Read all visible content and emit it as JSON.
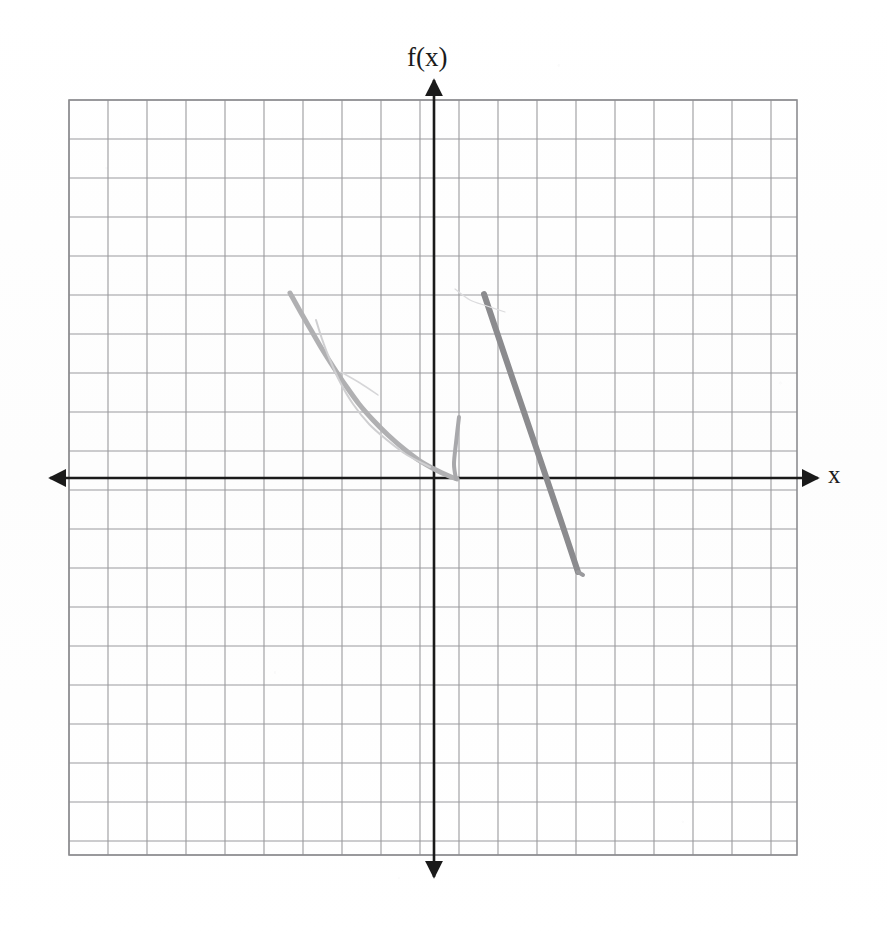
{
  "figure": {
    "kind": "hand-drawn-graph-worksheet",
    "background_color": "#fefefe",
    "grid": {
      "line_color": "#9a9a9d",
      "border_color": "#8d8d90",
      "cell_size_px": 39,
      "left_px": 69,
      "top_px": 100,
      "right_px": 797,
      "bottom_px": 855,
      "columns": 19,
      "rows": 19
    },
    "axes": {
      "color": "#1a1a1a",
      "x_axis_y_px": 478,
      "y_axis_x_px": 434,
      "x_axis_start_px": 50,
      "x_axis_end_px": 818,
      "y_axis_start_px": 80,
      "y_axis_end_px": 877,
      "arrowheads": [
        "left",
        "right",
        "up",
        "down"
      ]
    },
    "labels": {
      "y_axis": "f(x)",
      "x_axis": "x"
    }
  },
  "chart_data": {
    "type": "line",
    "title": "",
    "xlabel": "x",
    "ylabel": "f(x)",
    "grid": true,
    "legend": null,
    "axis_origin_px": {
      "x": 434,
      "y": 478
    },
    "unit_px": 39,
    "xlim": [
      -9.36,
      9.31
    ],
    "ylim": [
      -9.67,
      9.69
    ],
    "series": [
      {
        "name": "left-decreasing-curve",
        "stroke_color": "#b0b0b2",
        "stroke_width": 5,
        "description": "hand-drawn convex decreasing curve from upper-left down to the x-axis just right of the y-axis",
        "points_px": [
          [
            290,
            293
          ],
          [
            300,
            311
          ],
          [
            311,
            330
          ],
          [
            322,
            349
          ],
          [
            334,
            368
          ],
          [
            346,
            386
          ],
          [
            359,
            404
          ],
          [
            373,
            420
          ],
          [
            388,
            435
          ],
          [
            404,
            449
          ],
          [
            420,
            461
          ],
          [
            436,
            470
          ],
          [
            449,
            476
          ],
          [
            457,
            479
          ]
        ],
        "points_units": [
          [
            -3.69,
            4.74
          ],
          [
            -3.44,
            4.28
          ],
          [
            -3.15,
            3.79
          ],
          [
            -2.87,
            3.31
          ],
          [
            -2.56,
            2.82
          ],
          [
            -2.26,
            2.36
          ],
          [
            -1.92,
            1.9
          ],
          [
            -1.56,
            1.49
          ],
          [
            -1.18,
            1.1
          ],
          [
            -0.77,
            0.74
          ],
          [
            -0.36,
            0.44
          ],
          [
            0.05,
            0.21
          ],
          [
            0.38,
            0.05
          ],
          [
            0.59,
            -0.03
          ]
        ]
      },
      {
        "name": "ghost-erased-stroke",
        "stroke_color": "#cfcfd1",
        "stroke_width": 2,
        "description": "faint erased pencil stroke paralleling the upper part of the left curve",
        "points_px": [
          [
            316,
            320
          ],
          [
            322,
            339
          ],
          [
            330,
            360
          ],
          [
            340,
            382
          ],
          [
            353,
            404
          ],
          [
            369,
            424
          ],
          [
            387,
            440
          ],
          [
            407,
            455
          ],
          [
            430,
            467
          ]
        ],
        "points_units": [
          [
            -3.03,
            4.05
          ],
          [
            -2.87,
            3.56
          ],
          [
            -2.67,
            3.03
          ],
          [
            -2.41,
            2.46
          ],
          [
            -2.08,
            1.9
          ],
          [
            -1.67,
            1.38
          ],
          [
            -1.21,
            0.97
          ],
          [
            -0.69,
            0.59
          ],
          [
            -0.1,
            0.28
          ]
        ]
      },
      {
        "name": "faint-crossing-wisp",
        "stroke_color": "#d6d6d8",
        "stroke_width": 1.5,
        "description": "very light stray pencil wisp crossing the left curve mid-way",
        "points_px": [
          [
            341,
            372
          ],
          [
            360,
            383
          ],
          [
            378,
            395
          ]
        ],
        "points_units": [
          [
            -2.38,
            2.72
          ],
          [
            -1.9,
            2.44
          ],
          [
            -1.44,
            2.13
          ]
        ]
      },
      {
        "name": "short-vertical-hook",
        "stroke_color": "#a8a8ab",
        "stroke_width": 4,
        "description": "short nearly vertical stroke just right of the y-axis, descending to the x-axis",
        "points_px": [
          [
            459,
            417
          ],
          [
            456,
            443
          ],
          [
            454,
            464
          ],
          [
            456,
            479
          ]
        ],
        "points_units": [
          [
            0.64,
            1.56
          ],
          [
            0.56,
            0.9
          ],
          [
            0.51,
            0.36
          ],
          [
            0.56,
            -0.03
          ]
        ]
      },
      {
        "name": "right-descending-line",
        "stroke_color": "#8b8b8e",
        "stroke_width": 6,
        "description": "steep straight descending segment crossing the x-axis, darker graphite",
        "points_px": [
          [
            484,
            294
          ],
          [
            512,
            377
          ],
          [
            540,
            459
          ],
          [
            561,
            521
          ],
          [
            578,
            572
          ]
        ],
        "points_units": [
          [
            1.28,
            4.72
          ],
          [
            2.0,
            2.59
          ],
          [
            2.72,
            0.49
          ],
          [
            3.26,
            -1.1
          ],
          [
            3.69,
            -2.41
          ]
        ]
      },
      {
        "name": "right-line-tip-hook",
        "stroke_color": "#9a9a9d",
        "stroke_width": 4,
        "description": "small hook at the lower end of the right descending line",
        "points_px": [
          [
            578,
            572
          ],
          [
            583,
            575
          ]
        ],
        "points_units": [
          [
            3.69,
            -2.41
          ],
          [
            3.82,
            -2.49
          ]
        ]
      },
      {
        "name": "top-stray-wisp",
        "stroke_color": "#dcdcde",
        "stroke_width": 1.2,
        "description": "faint stray mark above the origin near the y-axis",
        "points_px": [
          [
            455,
            289
          ],
          [
            470,
            300
          ],
          [
            487,
            306
          ],
          [
            505,
            312
          ]
        ],
        "points_units": [
          [
            0.54,
            4.85
          ],
          [
            0.92,
            4.56
          ],
          [
            1.36,
            4.41
          ],
          [
            1.82,
            4.26
          ]
        ]
      }
    ]
  }
}
